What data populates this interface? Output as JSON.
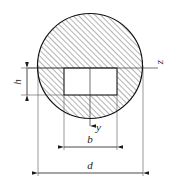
{
  "figure": {
    "type": "engineering-cross-section",
    "background_color": "#ffffff",
    "line_color": "#1a1a1a",
    "hatch_color": "#555555",
    "hole_fill": "#ffffff"
  },
  "shapes": {
    "circle": {
      "name": "outer-circle",
      "center_x": 90,
      "center_y": 66,
      "radius": 52.5,
      "hatched": true
    },
    "rectangle": {
      "name": "inner-rectangle-hole",
      "left": 64,
      "top": 68,
      "right": 117,
      "bottom": 95,
      "width": 53,
      "height": 27,
      "hatched": false
    }
  },
  "axes": {
    "horizontal": {
      "label": "z",
      "name": "z-axis",
      "y": 68,
      "x_start": 28,
      "x_end": 158,
      "label_x": 163,
      "label_y": 62
    },
    "vertical": {
      "label": "y",
      "name": "y-axis",
      "x": 90,
      "y_start": 68,
      "y_end": 128,
      "arrow": "down",
      "label_x": 95,
      "label_y": 131
    }
  },
  "dimensions": [
    {
      "label": "h",
      "name": "height-dimension",
      "orientation": "vertical",
      "x": 25,
      "y_start": 68,
      "y_end": 95,
      "label_x": 21,
      "label_y": 82
    },
    {
      "label": "b",
      "name": "width-dimension-b",
      "orientation": "horizontal",
      "y": 146,
      "x_start": 64,
      "x_end": 117,
      "label_x": 90,
      "label_y": 140
    },
    {
      "label": "d",
      "name": "diameter-dimension-d",
      "orientation": "horizontal",
      "y": 172,
      "x_start": 38,
      "x_end": 143,
      "label_x": 90,
      "label_y": 166
    }
  ],
  "extension_lines": {
    "names": [
      "ext-left-h-top",
      "ext-left-h-bottom",
      "ext-rect-left",
      "ext-rect-right",
      "ext-circle-left",
      "ext-circle-right"
    ]
  }
}
